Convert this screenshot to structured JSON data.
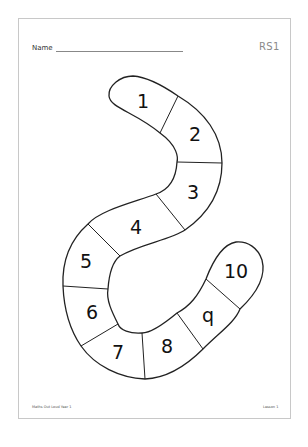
{
  "header": {
    "name_label": "Name",
    "sheet_code": "RS1"
  },
  "snake": {
    "squares": [
      {
        "number": "1"
      },
      {
        "number": "2"
      },
      {
        "number": "3"
      },
      {
        "number": "4"
      },
      {
        "number": "5"
      },
      {
        "number": "6"
      },
      {
        "number": "7"
      },
      {
        "number": "8"
      },
      {
        "number": "q"
      },
      {
        "number": "10"
      }
    ]
  },
  "footer": {
    "left": "Maths Out Loud Year 1",
    "right": "Lesson 1"
  },
  "colors": {
    "outline": "#222222",
    "page_border": "#c8c8c8",
    "code_text": "#8a8a8a"
  }
}
